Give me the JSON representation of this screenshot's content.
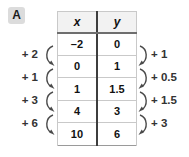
{
  "badge": {
    "label": "A"
  },
  "table": {
    "headers": [
      "x",
      "y"
    ],
    "rows": [
      {
        "x": "–2",
        "y": "0"
      },
      {
        "x": "0",
        "y": "1"
      },
      {
        "x": "1",
        "y": "1.5"
      },
      {
        "x": "4",
        "y": "3"
      },
      {
        "x": "10",
        "y": "6"
      }
    ]
  },
  "annotations": {
    "left": [
      "+ 2",
      "+ 1",
      "+ 3",
      "+ 6"
    ],
    "right": [
      "+ 1",
      "+ 0.5",
      "+ 1.5",
      "+ 3"
    ]
  },
  "colors": {
    "badge_bg": "#dcdcdc",
    "header_bg": "#f2f2f2",
    "divider": "#3d3d3d",
    "arrow": "#4a4a4a",
    "text": "#111111"
  }
}
